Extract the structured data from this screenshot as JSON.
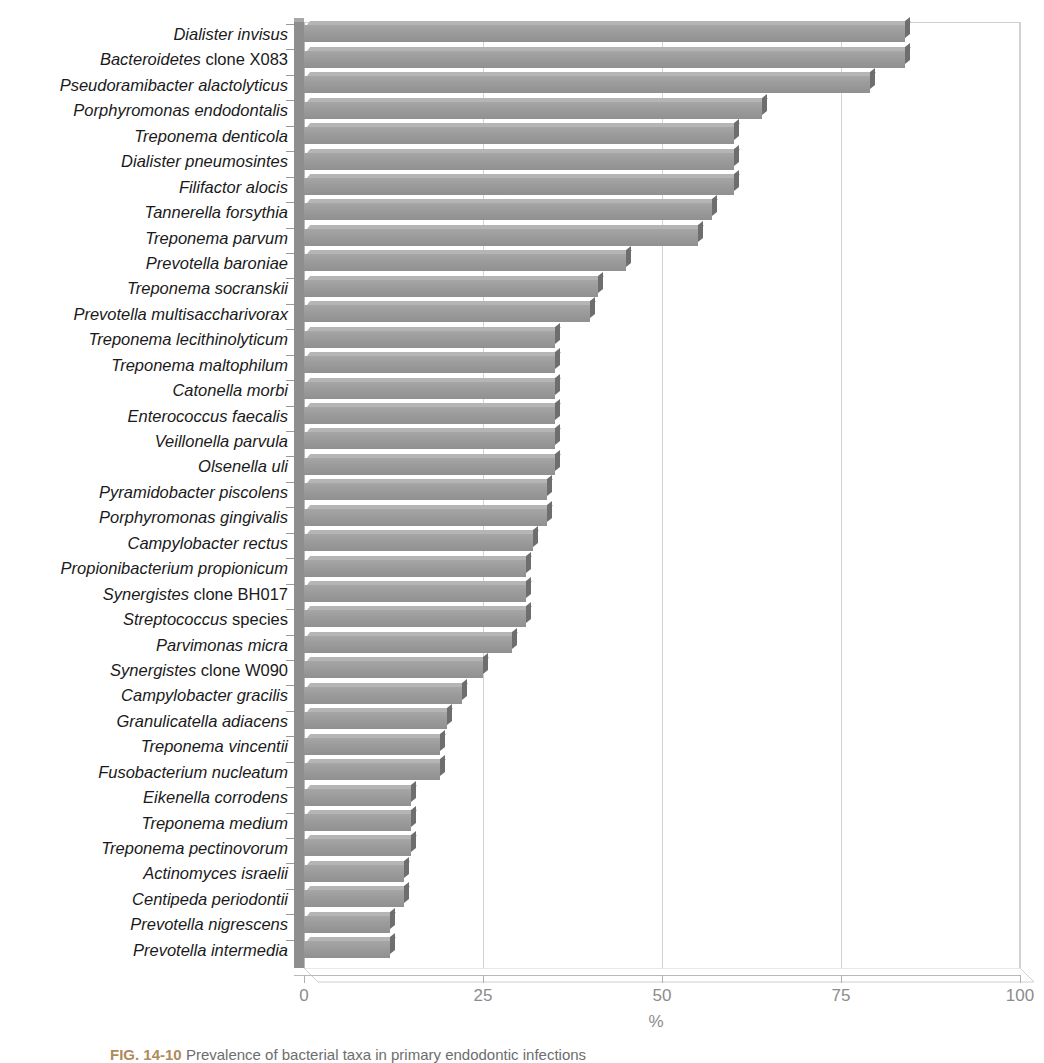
{
  "figure": {
    "caption_figure_number": "FIG. 14-10",
    "caption_text": "Prevalence of bacterial taxa in primary endodontic infections"
  },
  "axis": {
    "x_title": "%",
    "x_ticks": [
      "0",
      "25",
      "50",
      "75",
      "100"
    ],
    "x_tick_values": [
      0,
      25,
      50,
      75,
      100
    ],
    "x_min": 0,
    "x_max": 100
  },
  "style": {
    "bar_fill": "#9a9a9a",
    "bar_top": "#b5b5b5",
    "bar_side": "#6e6e6e",
    "grid_color": "#d2d2d2",
    "tick_label_color": "#8c8c8c",
    "label_color": "#1a1a1a"
  },
  "chart_data": {
    "type": "bar",
    "orientation": "horizontal",
    "title": "",
    "subtitle": "",
    "xlabel": "%",
    "ylabel": "",
    "xlim": [
      0,
      100
    ],
    "xticks": [
      0,
      25,
      50,
      75,
      100
    ],
    "grid": true,
    "legend": null,
    "categories": [
      "Dialister invisus",
      "Bacteroidetes clone X083",
      "Pseudoramibacter alactolyticus",
      "Porphyromonas endodontalis",
      "Treponema denticola",
      "Dialister pneumosintes",
      "Filifactor alocis",
      "Tannerella forsythia",
      "Treponema parvum",
      "Prevotella baroniae",
      "Treponema socranskii",
      "Prevotella multisaccharivorax",
      "Treponema lecithinolyticum",
      "Treponema maltophilum",
      "Catonella morbi",
      "Enterococcus faecalis",
      "Veillonella parvula",
      "Olsenella uli",
      "Pyramidobacter piscolens",
      "Porphyromonas gingivalis",
      "Campylobacter rectus",
      "Propionibacterium propionicum",
      "Synergistes clone BH017",
      "Streptococcus species",
      "Parvimonas micra",
      "Synergistes clone W090",
      "Campylobacter gracilis",
      "Granulicatella adiacens",
      "Treponema vincentii",
      "Fusobacterium nucleatum",
      "Eikenella corrodens",
      "Treponema medium",
      "Treponema pectinovorum",
      "Actinomyces israelii",
      "Centipeda periodontii",
      "Prevotella nigrescens",
      "Prevotella intermedia"
    ],
    "values": [
      84,
      84,
      79,
      64,
      60,
      60,
      60,
      57,
      55,
      45,
      41,
      40,
      35,
      35,
      35,
      35,
      35,
      35,
      34,
      34,
      32,
      31,
      31,
      31,
      29,
      25,
      22,
      20,
      19,
      19,
      15,
      15,
      15,
      14,
      14,
      12,
      12
    ],
    "category_styles": [
      {
        "label": "Dialister invisus",
        "italic_part": "Dialister invisus",
        "roman_part": ""
      },
      {
        "label": "Bacteroidetes clone X083",
        "italic_part": "Bacteroidetes",
        "roman_part": " clone X083"
      },
      {
        "label": "Pseudoramibacter alactolyticus",
        "italic_part": "Pseudoramibacter alactolyticus",
        "roman_part": ""
      },
      {
        "label": "Porphyromonas endodontalis",
        "italic_part": "Porphyromonas endodontalis",
        "roman_part": ""
      },
      {
        "label": "Treponema denticola",
        "italic_part": "Treponema denticola",
        "roman_part": ""
      },
      {
        "label": "Dialister pneumosintes",
        "italic_part": "Dialister pneumosintes",
        "roman_part": ""
      },
      {
        "label": "Filifactor alocis",
        "italic_part": "Filifactor alocis",
        "roman_part": ""
      },
      {
        "label": "Tannerella forsythia",
        "italic_part": "Tannerella forsythia",
        "roman_part": ""
      },
      {
        "label": "Treponema parvum",
        "italic_part": "Treponema parvum",
        "roman_part": ""
      },
      {
        "label": "Prevotella baroniae",
        "italic_part": "Prevotella baroniae",
        "roman_part": ""
      },
      {
        "label": "Treponema socranskii",
        "italic_part": "Treponema socranskii",
        "roman_part": ""
      },
      {
        "label": "Prevotella multisaccharivorax",
        "italic_part": "Prevotella multisaccharivorax",
        "roman_part": ""
      },
      {
        "label": "Treponema lecithinolyticum",
        "italic_part": "Treponema lecithinolyticum",
        "roman_part": ""
      },
      {
        "label": "Treponema maltophilum",
        "italic_part": "Treponema maltophilum",
        "roman_part": ""
      },
      {
        "label": "Catonella morbi",
        "italic_part": "Catonella morbi",
        "roman_part": ""
      },
      {
        "label": "Enterococcus faecalis",
        "italic_part": "Enterococcus faecalis",
        "roman_part": ""
      },
      {
        "label": "Veillonella parvula",
        "italic_part": "Veillonella parvula",
        "roman_part": ""
      },
      {
        "label": "Olsenella uli",
        "italic_part": "Olsenella uli",
        "roman_part": ""
      },
      {
        "label": "Pyramidobacter piscolens",
        "italic_part": "Pyramidobacter piscolens",
        "roman_part": ""
      },
      {
        "label": "Porphyromonas gingivalis",
        "italic_part": "Porphyromonas gingivalis",
        "roman_part": ""
      },
      {
        "label": "Campylobacter rectus",
        "italic_part": "Campylobacter rectus",
        "roman_part": ""
      },
      {
        "label": "Propionibacterium propionicum",
        "italic_part": "Propionibacterium propionicum",
        "roman_part": ""
      },
      {
        "label": "Synergistes clone BH017",
        "italic_part": "Synergistes",
        "roman_part": " clone BH017"
      },
      {
        "label": "Streptococcus species",
        "italic_part": "Streptococcus",
        "roman_part": " species"
      },
      {
        "label": "Parvimonas micra",
        "italic_part": "Parvimonas micra",
        "roman_part": ""
      },
      {
        "label": "Synergistes clone W090",
        "italic_part": "Synergistes",
        "roman_part": " clone W090"
      },
      {
        "label": "Campylobacter gracilis",
        "italic_part": "Campylobacter gracilis",
        "roman_part": ""
      },
      {
        "label": "Granulicatella adiacens",
        "italic_part": "Granulicatella adiacens",
        "roman_part": ""
      },
      {
        "label": "Treponema vincentii",
        "italic_part": "Treponema vincentii",
        "roman_part": ""
      },
      {
        "label": "Fusobacterium nucleatum",
        "italic_part": "Fusobacterium nucleatum",
        "roman_part": ""
      },
      {
        "label": "Eikenella corrodens",
        "italic_part": "Eikenella corrodens",
        "roman_part": ""
      },
      {
        "label": "Treponema medium",
        "italic_part": "Treponema medium",
        "roman_part": ""
      },
      {
        "label": "Treponema pectinovorum",
        "italic_part": "Treponema pectinovorum",
        "roman_part": ""
      },
      {
        "label": "Actinomyces israelii",
        "italic_part": "Actinomyces israelii",
        "roman_part": ""
      },
      {
        "label": "Centipeda periodontii",
        "italic_part": "Centipeda periodontii",
        "roman_part": ""
      },
      {
        "label": "Prevotella nigrescens",
        "italic_part": "Prevotella nigrescens",
        "roman_part": ""
      },
      {
        "label": "Prevotella intermedia",
        "italic_part": "Prevotella intermedia",
        "roman_part": ""
      }
    ]
  }
}
